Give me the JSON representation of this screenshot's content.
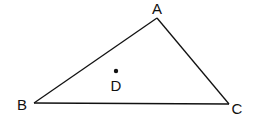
{
  "diagram": {
    "type": "triangle",
    "stroke_color": "#111111",
    "background": "#ffffff",
    "vertices": [
      {
        "label": "A",
        "x": 157,
        "y": 18,
        "label_x": 157,
        "label_y": 14
      },
      {
        "label": "B",
        "x": 34,
        "y": 103,
        "label_x": 22,
        "label_y": 110
      },
      {
        "label": "C",
        "x": 229,
        "y": 104,
        "label_x": 237,
        "label_y": 114
      }
    ],
    "edges": [
      [
        "A",
        "B"
      ],
      [
        "B",
        "C"
      ],
      [
        "C",
        "A"
      ]
    ],
    "points": [
      {
        "label": "D",
        "x": 116,
        "y": 71,
        "label_x": 116,
        "label_y": 91
      }
    ]
  }
}
